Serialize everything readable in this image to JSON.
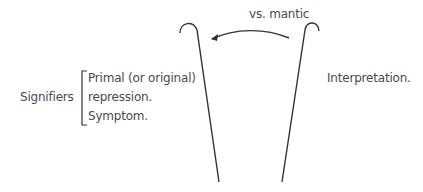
{
  "diagram": {
    "arrow_label": "vs. mantic",
    "left_label": "Signifiers",
    "bracket_items": [
      "Primal (or original)",
      "repression.",
      "Symptom."
    ],
    "right_label": "Interpretation.",
    "line_color": "#333333",
    "text_color": "#4a4a4a"
  }
}
